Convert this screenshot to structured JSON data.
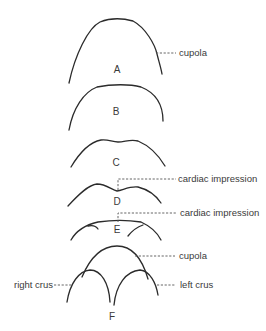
{
  "diagram": {
    "panels": [
      {
        "id": "A",
        "label": "A",
        "annotation": "cupola"
      },
      {
        "id": "B",
        "label": "B"
      },
      {
        "id": "C",
        "label": "C"
      },
      {
        "id": "D",
        "label": "D",
        "annotation": "cardiac impression"
      },
      {
        "id": "E",
        "label": "E",
        "annotation": "cardiac impression"
      },
      {
        "id": "F",
        "label": "F",
        "annotations": {
          "top": "cupola",
          "left": "right crus",
          "right": "left crus"
        }
      }
    ],
    "colors": {
      "stroke": "#2b2b2b",
      "text": "#3a3a3a",
      "background": "#ffffff"
    }
  }
}
